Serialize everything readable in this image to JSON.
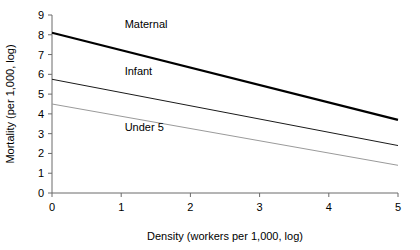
{
  "chart_data": {
    "type": "line",
    "title": "",
    "xlabel": "Density (workers per 1,000, log)",
    "ylabel": "Mortality (per 1,000, log)",
    "xlim": [
      0,
      5
    ],
    "ylim": [
      0,
      9
    ],
    "xticks": [
      "0",
      "1",
      "2",
      "3",
      "4",
      "5"
    ],
    "yticks": [
      "0",
      "1",
      "2",
      "3",
      "4",
      "5",
      "6",
      "7",
      "8",
      "9"
    ],
    "grid": false,
    "legend_position": "inline-labels",
    "x": [
      0,
      5
    ],
    "series": [
      {
        "name": "Maternal",
        "values": [
          8.1,
          3.7
        ],
        "color": "#000000",
        "line_width": 2.2,
        "label_x": 1.05,
        "label_y": 8.35
      },
      {
        "name": "Infant",
        "values": [
          5.75,
          2.4
        ],
        "color": "#1a1a1a",
        "line_width": 1.0,
        "label_x": 1.05,
        "label_y": 5.95
      },
      {
        "name": "Under 5",
        "values": [
          4.5,
          1.4
        ],
        "color": "#9a9a9a",
        "line_width": 1.0,
        "label_x": 1.05,
        "label_y": 3.15
      }
    ],
    "axis_color": "#6b6b6b"
  },
  "labels": {
    "xtick_0": "0",
    "xtick_1": "1",
    "xtick_2": "2",
    "xtick_3": "3",
    "xtick_4": "4",
    "xtick_5": "5",
    "ytick_0": "0",
    "ytick_1": "1",
    "ytick_2": "2",
    "ytick_3": "3",
    "ytick_4": "4",
    "ytick_5": "5",
    "ytick_6": "6",
    "ytick_7": "7",
    "ytick_8": "8",
    "ytick_9": "9",
    "series_maternal": "Maternal",
    "series_infant": "Infant",
    "series_under5": "Under 5",
    "x_axis_title": "Density (workers per 1,000, log)",
    "y_axis_title": "Mortality (per 1,000, log)"
  }
}
